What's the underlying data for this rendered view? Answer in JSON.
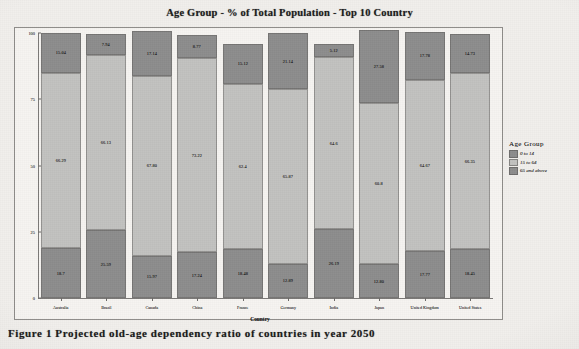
{
  "figure": {
    "caption": "Figure 1 Projected old-age dependency ratio of countries in year 2050"
  },
  "legend": {
    "title": "Age  Group",
    "position": "right"
  },
  "chart_data": {
    "type": "bar",
    "subtype": "stacked-bar-100",
    "title": "Age Group - % of Total Population - Top 10 Country",
    "xlabel": "Country",
    "ylabel": "% of Total Population",
    "ylim": [
      0,
      100
    ],
    "yticks": [
      "0",
      "25",
      "50",
      "75",
      "100"
    ],
    "grid": false,
    "categories": [
      "Australia",
      "Brazil",
      "Canada",
      "China",
      "France",
      "Germany",
      "India",
      "Japan",
      "United Kingdom",
      "United States"
    ],
    "series": [
      {
        "name": "0 to 14",
        "color": "#8d8d8d",
        "values": [
          18.7,
          25.59,
          15.97,
          17.24,
          18.48,
          12.89,
          26.19,
          12.8,
          17.77,
          18.45
        ]
      },
      {
        "name": "15 to 64",
        "color": "#c2c2c0",
        "values": [
          66.29,
          66.13,
          67.8,
          73.22,
          62.4,
          65.87,
          64.6,
          60.8,
          64.67,
          66.35
        ]
      },
      {
        "name": "65 and above",
        "color": "#8d8d8d",
        "values": [
          15.04,
          7.94,
          17.14,
          8.77,
          15.12,
          21.14,
          5.12,
          27.58,
          17.78,
          14.73
        ]
      }
    ],
    "bar_labels": {
      "0 to 14": [
        "18.7",
        "25.59",
        "15.97",
        "17.24",
        "18.48",
        "12.89",
        "26.19",
        "12.80",
        "17.77",
        "18.45"
      ],
      "15 to 64": [
        "66.29",
        "66.13",
        "67.80",
        "73.22",
        "62.4",
        "65.87",
        "64.6",
        "60.8",
        "64.67",
        "66.35"
      ],
      "65 and above": [
        "15.04",
        "7.94",
        "17.14",
        "8.77",
        "15.12",
        "21.14",
        "5.12",
        "27.58",
        "17.78",
        "14.73"
      ]
    }
  }
}
